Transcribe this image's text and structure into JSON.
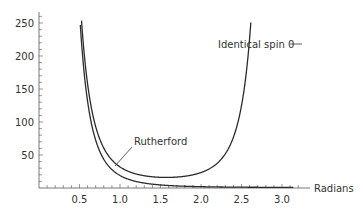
{
  "chart_data": {
    "type": "line",
    "title": "",
    "xlabel": "Radians",
    "ylabel": "",
    "xlim": [
      0,
      3.2
    ],
    "ylim": [
      0,
      260
    ],
    "x_ticks": [
      "0.5",
      "1.0",
      "1.5",
      "2.0",
      "2.5",
      "3.0"
    ],
    "y_ticks": [
      "50",
      "100",
      "150",
      "200",
      "250"
    ],
    "grid": false,
    "legend": "inline annotations",
    "series": [
      {
        "name": "Rutherford",
        "formula": "1/sin^4(theta/2)",
        "x": [
          0.5,
          0.6,
          0.7,
          0.8,
          0.9,
          1.0,
          1.2,
          1.4,
          1.6,
          2.0,
          2.4,
          2.8,
          3.14
        ],
        "values": [
          262,
          127,
          69,
          41,
          26,
          18,
          8.9,
          5.2,
          3.7,
          2.1,
          1.5,
          1.1,
          1.0
        ]
      },
      {
        "name": "Identical spin 0",
        "formula": "1/sin^4(theta/2) + 1/cos^4(theta/2) + 2/(sin^2(theta/2) cos^2(theta/2))",
        "x": [
          0.5,
          0.6,
          0.7,
          0.8,
          0.9,
          1.0,
          1.2,
          1.4,
          1.5708,
          1.8,
          2.0,
          2.2,
          2.4,
          2.5,
          2.6
        ],
        "values": [
          296,
          150,
          86,
          55,
          38,
          29,
          20,
          17,
          16,
          18,
          23,
          34,
          61,
          89,
          140
        ]
      }
    ]
  },
  "annotations": {
    "rutherford": "Rutherford",
    "identical": "Identical spin 0"
  },
  "axes": {
    "x_label": "Radians",
    "x_ticks": [
      {
        "value": 0.5,
        "label": "0.5"
      },
      {
        "value": 1.0,
        "label": "1.0"
      },
      {
        "value": 1.5,
        "label": "1.5"
      },
      {
        "value": 2.0,
        "label": "2.0"
      },
      {
        "value": 2.5,
        "label": "2.5"
      },
      {
        "value": 3.0,
        "label": "3.0"
      }
    ],
    "y_ticks": [
      {
        "value": 50,
        "label": "50"
      },
      {
        "value": 100,
        "label": "100"
      },
      {
        "value": 150,
        "label": "150"
      },
      {
        "value": 200,
        "label": "200"
      },
      {
        "value": 250,
        "label": "250"
      }
    ]
  },
  "colors": {
    "line": "#2b2b2b",
    "axis": "#555555",
    "text": "#333333"
  }
}
